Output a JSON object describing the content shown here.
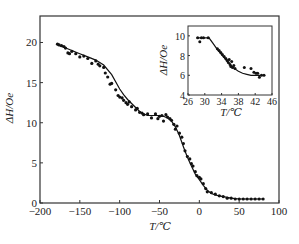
{
  "chart_data": [
    {
      "type": "line",
      "role": "main",
      "title": "",
      "xlabel": "T/℃",
      "ylabel": "ΔH/Oe",
      "xlim": [
        -200,
        100
      ],
      "ylim": [
        0,
        23.3
      ],
      "xticks": [
        -200,
        -150,
        -100,
        -50,
        0,
        50,
        100
      ],
      "yticks": [
        0,
        5,
        10,
        15,
        20
      ],
      "xtick_labels": [
        "−200",
        "−150",
        "−100",
        "−50",
        "0",
        "50",
        "100"
      ],
      "ytick_labels": [
        "0",
        "5",
        "10",
        "15",
        "20"
      ],
      "grid": false,
      "legend": null,
      "series": [
        {
          "name": "fit",
          "style": "line",
          "x": [
            -180,
            -170,
            -160,
            -150,
            -140,
            -130,
            -120,
            -110,
            -100,
            -95,
            -90,
            -85,
            -80,
            -75,
            -70,
            -65,
            -60,
            -55,
            -50,
            -45,
            -40,
            -35,
            -30,
            -25,
            -20,
            -15,
            -10,
            -5,
            0,
            5,
            10,
            15,
            20,
            25,
            30,
            40,
            50,
            60,
            70,
            80
          ],
          "y": [
            19.8,
            19.4,
            19.0,
            18.6,
            18.2,
            17.8,
            17.2,
            16.0,
            14.2,
            13.5,
            12.9,
            12.4,
            11.9,
            11.4,
            11.1,
            10.9,
            10.9,
            10.9,
            10.9,
            10.8,
            10.6,
            10.2,
            9.5,
            8.4,
            7.0,
            5.7,
            4.6,
            3.6,
            2.9,
            2.2,
            1.6,
            1.2,
            1.0,
            0.9,
            0.8,
            0.6,
            0.5,
            0.5,
            0.5,
            0.5
          ]
        },
        {
          "name": "measured",
          "style": "scatter",
          "x": [
            -178,
            -176,
            -173,
            -170,
            -168,
            -165,
            -163,
            -160,
            -155,
            -150,
            -145,
            -140,
            -135,
            -130,
            -127,
            -125,
            -120,
            -118,
            -115,
            -112,
            -110,
            -105,
            -102,
            -100,
            -97,
            -95,
            -92,
            -90,
            -88,
            -85,
            -80,
            -78,
            -75,
            -72,
            -70,
            -65,
            -60,
            -55,
            -52,
            -50,
            -47,
            -45,
            -42,
            -40,
            -37,
            -35,
            -32,
            -30,
            -28,
            -25,
            -22,
            -20,
            -18,
            -15,
            -12,
            -10,
            -8,
            -5,
            -3,
            0,
            2,
            5,
            8,
            10,
            15,
            20,
            25,
            30,
            35,
            40,
            45,
            50,
            55,
            60,
            65,
            70,
            75,
            80
          ],
          "y": [
            19.8,
            19.7,
            19.6,
            19.5,
            19.3,
            18.7,
            18.6,
            18.9,
            18.6,
            18.2,
            18.3,
            18.0,
            17.4,
            17.7,
            17.3,
            17.1,
            16.9,
            16.2,
            15.7,
            14.8,
            14.9,
            14.1,
            13.4,
            13.2,
            13.1,
            12.8,
            12.5,
            12.3,
            12.6,
            12.0,
            11.6,
            11.8,
            11.3,
            11.2,
            11.0,
            11.1,
            10.6,
            11.1,
            10.5,
            10.8,
            10.9,
            10.2,
            11.0,
            10.7,
            10.5,
            10.3,
            9.8,
            9.2,
            9.6,
            8.7,
            8.2,
            7.4,
            6.5,
            5.8,
            5.5,
            4.9,
            4.6,
            3.9,
            3.4,
            3.2,
            3.0,
            2.4,
            1.8,
            1.4,
            1.3,
            1.1,
            0.9,
            0.8,
            0.6,
            0.6,
            0.5,
            0.5,
            0.5,
            0.5,
            0.5,
            0.5,
            0.5,
            0.5
          ]
        }
      ]
    },
    {
      "type": "line",
      "role": "inset",
      "title": "",
      "xlabel": "T/℃",
      "ylabel": "ΔH/Oe",
      "xlim": [
        26,
        46
      ],
      "ylim": [
        4,
        11
      ],
      "xticks": [
        26,
        30,
        34,
        38,
        42,
        46
      ],
      "yticks": [
        4,
        6,
        8,
        10
      ],
      "xtick_labels": [
        "26",
        "30",
        "34",
        "38",
        "42",
        "46"
      ],
      "ytick_labels": [
        "4",
        "6",
        "8",
        "10"
      ],
      "grid": false,
      "legend": null,
      "series": [
        {
          "name": "fit",
          "style": "line",
          "x": [
            28,
            29,
            30,
            31,
            32,
            33,
            34,
            35,
            36,
            37,
            38,
            39,
            40,
            41,
            42,
            43,
            44
          ],
          "y": [
            9.8,
            9.8,
            9.8,
            9.8,
            9.2,
            8.6,
            8.1,
            7.6,
            7.1,
            6.7,
            6.4,
            6.2,
            6.1,
            6.0,
            6.0,
            6.0,
            6.0
          ]
        },
        {
          "name": "measured",
          "style": "scatter",
          "x": [
            28.3,
            28.8,
            29.2,
            29.7,
            30.8,
            33.0,
            33.4,
            33.8,
            34.2,
            34.6,
            35.0,
            35.3,
            35.6,
            35.8,
            36.0,
            36.2,
            36.4,
            36.6,
            36.9,
            37.2,
            39.4,
            41.0,
            41.7,
            42.2,
            42.6,
            43.0,
            43.5,
            44.1
          ],
          "y": [
            9.8,
            9.4,
            9.8,
            9.8,
            9.8,
            8.7,
            8.5,
            8.3,
            8.1,
            7.9,
            7.7,
            7.5,
            7.3,
            7.6,
            7.1,
            6.9,
            7.4,
            6.8,
            7.0,
            6.7,
            6.8,
            6.7,
            6.3,
            6.2,
            6.2,
            5.8,
            6.0,
            6.0
          ]
        }
      ]
    }
  ],
  "labels": {
    "main_xlabel": "T/℃",
    "main_ylabel": "ΔH/Oe",
    "inset_xlabel": "T/℃",
    "inset_ylabel": "ΔH/Oe"
  }
}
